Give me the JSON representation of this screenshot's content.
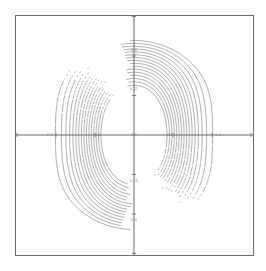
{
  "figure": {
    "title": "",
    "background_color": "#ffffff",
    "frame_color": "#6e6e6e",
    "contour_color": "#3c3c3c",
    "axis_color": "#5a5a5a",
    "label_color": "#7a7a7a"
  },
  "chart_data": {
    "type": "line",
    "plot_kind": "contour",
    "title": "",
    "subtitle": "",
    "xlabel": "",
    "ylabel": "",
    "xlim": [
      -1.5,
      1.5
    ],
    "ylim": [
      -1.5,
      1.5
    ],
    "grid": false,
    "legend": "none",
    "axes": {
      "x_axis_at_y": 0,
      "y_axis_at_x": 0,
      "x_ticks": [
        -1.5,
        -1.0,
        -0.5,
        0,
        0.5,
        1.0,
        1.5
      ],
      "y_ticks": [
        -1.5,
        -1.0,
        -0.5,
        0,
        0.5,
        1.0,
        1.5
      ],
      "tick_labels_visible": false
    },
    "symmetry": [
      "mirror about vertical axis",
      "mirror about horizontal axis"
    ],
    "extrema": [
      {
        "name": "left-lobe-center",
        "x": -0.82,
        "y": 0.0
      },
      {
        "name": "center-lobe-center",
        "x": 0.0,
        "y": 0.0
      },
      {
        "name": "right-lobe-center",
        "x": 0.82,
        "y": 0.0
      }
    ],
    "saddles": [
      {
        "name": "upper-saddle",
        "x": 0.0,
        "y": 0.95
      },
      {
        "name": "lower-saddle",
        "x": 0.0,
        "y": -0.95
      }
    ],
    "levels": [
      0.05,
      0.1,
      0.15,
      0.2,
      0.25,
      0.3,
      0.35,
      0.4,
      0.45,
      0.5,
      0.55,
      0.6,
      0.65,
      0.7,
      0.75,
      0.8
    ],
    "n_levels": 16,
    "contour_labels": [
      {
        "text": "0.4",
        "x": 0.0,
        "y": 1.08
      },
      {
        "text": "0.25",
        "x": 0.0,
        "y": 0.58
      },
      {
        "text": "0.1",
        "x": 0.0,
        "y": 0.0
      },
      {
        "text": "0.25",
        "x": 0.0,
        "y": -0.58
      },
      {
        "text": "0.4",
        "x": 0.0,
        "y": -1.08
      },
      {
        "text": "0.2",
        "x": -0.46,
        "y": 0.0
      },
      {
        "text": "0.2",
        "x": 0.46,
        "y": 0.0
      },
      {
        "text": "0.1",
        "x": -1.08,
        "y": 0.0
      },
      {
        "text": "0.1",
        "x": 1.08,
        "y": 0.0
      }
    ]
  }
}
